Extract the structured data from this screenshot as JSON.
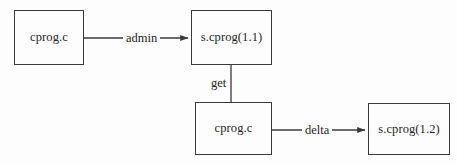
{
  "diagram": {
    "background_color": "#fdfdfd",
    "stroke_color": "#3a3a3a",
    "text_color": "#1d1d1d",
    "nodes": [
      {
        "id": "node-cprog-source",
        "label": "cprog.c",
        "x": 14,
        "y": 10,
        "w": 70,
        "h": 55
      },
      {
        "id": "node-scprog-11",
        "label": "s.cprog(1.1)",
        "x": 191,
        "y": 10,
        "w": 81,
        "h": 55
      },
      {
        "id": "node-cprog-working",
        "label": "cprog.c",
        "x": 195,
        "y": 102,
        "w": 77,
        "h": 53
      },
      {
        "id": "node-scprog-12",
        "label": "s.cprog(1.2)",
        "x": 368,
        "y": 103,
        "w": 82,
        "h": 52
      }
    ],
    "edges": [
      {
        "id": "edge-admin",
        "label": "admin",
        "from": "node-cprog-source",
        "to": "node-scprog-11",
        "label_x": 123,
        "label_y": 32
      },
      {
        "id": "edge-get",
        "label": "get",
        "from": "node-scprog-11",
        "to": "node-cprog-working",
        "label_x": 208,
        "label_y": 77
      },
      {
        "id": "edge-delta",
        "label": "delta",
        "from": "node-cprog-working",
        "to": "node-scprog-12",
        "label_x": 302,
        "label_y": 124
      }
    ]
  }
}
